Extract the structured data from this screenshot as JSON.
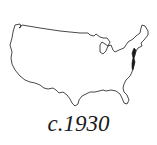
{
  "map": {
    "subject": "contiguous-united-states-outline",
    "outline_color": "#1a1a1a",
    "fill_color": "#ffffff",
    "background_color": "#ffffff"
  },
  "caption": {
    "text": "c.1930"
  }
}
